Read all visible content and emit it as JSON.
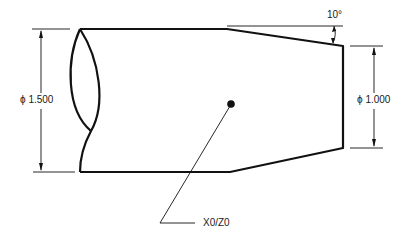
{
  "drawing": {
    "type": "turned part profile (lathe)",
    "dimensions": {
      "large_diameter": {
        "symbol": "φ",
        "value": "1.500",
        "label": "ϕ 1.500"
      },
      "small_diameter": {
        "symbol": "φ",
        "value": "1.000",
        "label": "ϕ 1.000"
      },
      "taper_angle": {
        "value": 10,
        "label": "10°"
      }
    },
    "origin": {
      "label": "X0/Z0"
    },
    "colors": {
      "line": "#111111",
      "background": "#ffffff"
    }
  }
}
